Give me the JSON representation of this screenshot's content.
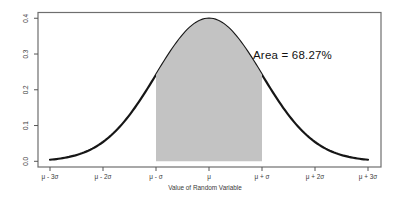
{
  "figure": {
    "background": "#ffffff",
    "width_px": 397,
    "height_px": 202
  },
  "chart_data": {
    "type": "area",
    "title": "",
    "xlabel": "Value of Random Variable",
    "ylabel": "",
    "distribution": "standard normal density curve",
    "curve": {
      "z_min": -3,
      "z_max": 3,
      "peak_density": 0.3989
    },
    "key_points": [
      {
        "x": "μ - 3σ",
        "z": -3,
        "density": 0.0044
      },
      {
        "x": "μ - 2σ",
        "z": -2,
        "density": 0.054
      },
      {
        "x": "μ - σ",
        "z": -1,
        "density": 0.242
      },
      {
        "x": "μ",
        "z": 0,
        "density": 0.399
      },
      {
        "x": "μ + σ",
        "z": 1,
        "density": 0.242
      },
      {
        "x": "μ + 2σ",
        "z": 2,
        "density": 0.054
      },
      {
        "x": "μ + 3σ",
        "z": 3,
        "density": 0.0044
      }
    ],
    "shaded_region": {
      "z_min": -1,
      "z_max": 1,
      "area_fraction": 0.6827
    },
    "annotation": "Area = 68.27%",
    "x_tick_values": [
      -3,
      -2,
      -1,
      0,
      1,
      2,
      3
    ],
    "x_tick_labels": [
      "μ - 3σ",
      "μ - 2σ",
      "μ - σ",
      "μ",
      "μ + σ",
      "μ + 2σ",
      "μ + 3σ"
    ],
    "y_tick_values": [
      0.0,
      0.1,
      0.2,
      0.3,
      0.4
    ],
    "y_tick_labels": [
      "0.0",
      "0.1",
      "0.2",
      "0.3",
      "0.4"
    ],
    "ylim": [
      0,
      0.4
    ],
    "grid": false,
    "legend": false,
    "colors": {
      "curve": "#161616",
      "shaded_fill": "#c3c3c3",
      "box": "#6e6e6e",
      "tick": "#555555",
      "tick_text": "#3a3a3a",
      "annotation_text": "#111111"
    }
  }
}
